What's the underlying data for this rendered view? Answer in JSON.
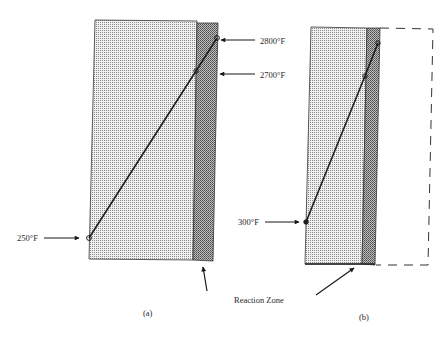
{
  "diagram": {
    "panel_a": {
      "caption": "(a)",
      "temperatures": {
        "top": "2800°F",
        "upper": "2700°F",
        "bottom": "250°F"
      }
    },
    "panel_b": {
      "caption": "(b)",
      "temperatures": {
        "bottom": "300°F"
      }
    },
    "reaction_zone_label": "Reaction Zone"
  },
  "colors": {
    "light_fill": "#d4d4d4",
    "dark_fill": "#8a8a8a",
    "line": "#222222"
  }
}
